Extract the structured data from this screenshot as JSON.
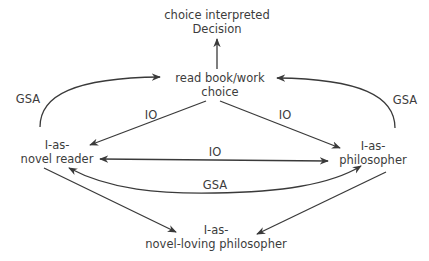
{
  "diagram": {
    "nodes": {
      "decision": {
        "line1": "choice interpreted",
        "line2": "Decision"
      },
      "choice": {
        "line1": "read book/work",
        "line2": "choice"
      },
      "novel_reader": {
        "line1": "I-as-",
        "line2": "novel reader"
      },
      "philosopher": {
        "line1": "I-as-",
        "line2": "philosopher"
      },
      "novel_loving_philosopher": {
        "line1": "I-as-",
        "line2": "novel-loving philosopher"
      }
    },
    "edges": [
      {
        "from": "choice",
        "to": "decision",
        "label": ""
      },
      {
        "from": "novel_reader",
        "to": "choice",
        "label": "GSA"
      },
      {
        "from": "philosopher",
        "to": "choice",
        "label": "GSA"
      },
      {
        "from": "choice",
        "to": "novel_reader",
        "label": "IO"
      },
      {
        "from": "choice",
        "to": "philosopher",
        "label": "IO"
      },
      {
        "from": "novel_reader",
        "to": "philosopher",
        "label": "IO",
        "bidirectional": true
      },
      {
        "from": "novel_reader",
        "to": "philosopher",
        "label": "GSA",
        "bidirectional": true
      },
      {
        "from": "novel_reader",
        "to": "novel_loving_philosopher",
        "label": ""
      },
      {
        "from": "philosopher",
        "to": "novel_loving_philosopher",
        "label": ""
      }
    ],
    "edge_labels": {
      "gsa_left": "GSA",
      "gsa_right": "GSA",
      "io_left": "IO",
      "io_right": "IO",
      "io_middle": "IO",
      "gsa_bottom": "GSA"
    },
    "colors": {
      "line": "#3a3a3a",
      "text": "#3c3c3c",
      "background": "#ffffff"
    }
  }
}
